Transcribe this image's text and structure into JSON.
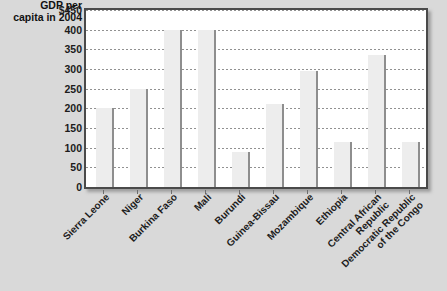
{
  "top_clipped_text": "",
  "axis_title": {
    "line1": "GDP per",
    "line2": "capita in 2004"
  },
  "chart_data": {
    "type": "bar",
    "title": "GDP per capita in 2004",
    "xlabel": "",
    "ylabel": "GDP per capita in 2004",
    "ylim": [
      0,
      450
    ],
    "ytick_labels": [
      "$450",
      "400",
      "350",
      "300",
      "250",
      "200",
      "150",
      "100",
      "50",
      "0"
    ],
    "ytick_values": [
      450,
      400,
      350,
      300,
      250,
      200,
      150,
      100,
      50,
      0
    ],
    "grid": true,
    "legend": "none",
    "categories": [
      "Sierra Leone",
      "Niger",
      "Burkina Faso",
      "Mali",
      "Burundi",
      "Guinea-Bissau",
      "Mozambique",
      "Ethiopia",
      "Central African\nRepublic",
      "Democratic Republic\nof the Congo"
    ],
    "values": [
      200,
      250,
      400,
      400,
      90,
      210,
      295,
      115,
      335,
      115
    ],
    "bar_color": "#ededed",
    "bar_edge_color": "#8e8e8e",
    "plot_background": "#ffffff",
    "page_background": "#d9d9d9"
  }
}
